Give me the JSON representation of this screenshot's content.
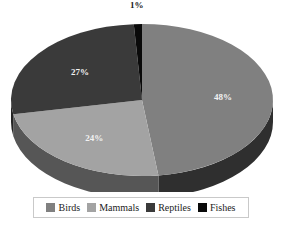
{
  "chart_data": {
    "type": "pie",
    "title": "",
    "labels": [
      "Birds",
      "Mammals",
      "Reptiles",
      "Fishes"
    ],
    "values": [
      48,
      24,
      27,
      1
    ],
    "value_labels": [
      "48%",
      "24%",
      "27%",
      "1%"
    ],
    "unit": "%",
    "colors": [
      "#808080",
      "#a3a3a3",
      "#3a3a3a",
      "#0a0a0a"
    ],
    "side_colors": [
      "#2f2f2f",
      "#565656",
      "#242424",
      "#050505"
    ],
    "three_d": true,
    "start_angle_deg": 0,
    "direction": "clockwise",
    "legend_position": "bottom",
    "grid": false,
    "slices": [
      {
        "label": "Birds",
        "value": 48,
        "value_label": "48%",
        "color": "#808080",
        "side_color": "#2f2f2f"
      },
      {
        "label": "Mammals",
        "value": 24,
        "value_label": "24%",
        "color": "#a3a3a3",
        "side_color": "#565656"
      },
      {
        "label": "Reptiles",
        "value": 27,
        "value_label": "27%",
        "color": "#3a3a3a",
        "side_color": "#242424"
      },
      {
        "label": "Fishes",
        "value": 1,
        "value_label": "1%",
        "color": "#0a0a0a",
        "side_color": "#050505"
      }
    ]
  },
  "legend": {
    "items": [
      {
        "label": "Birds",
        "color": "#808080"
      },
      {
        "label": "Mammals",
        "color": "#a3a3a3"
      },
      {
        "label": "Reptiles",
        "color": "#3a3a3a"
      },
      {
        "label": "Fishes",
        "color": "#0a0a0a"
      }
    ]
  },
  "labels": {
    "birds_pct": "48%",
    "mammals_pct": "24%",
    "reptiles_pct": "27%",
    "fishes_pct": "1%"
  }
}
